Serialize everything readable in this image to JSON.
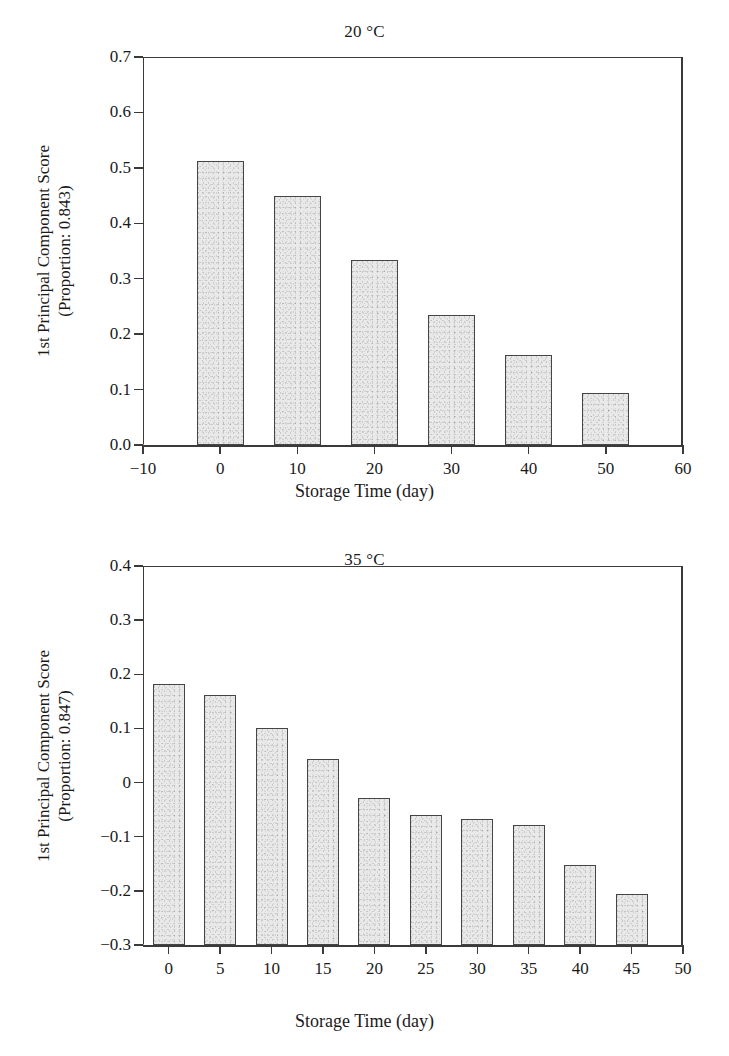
{
  "figure": {
    "background": "#ffffff",
    "bar_fill": "#e9e9e9",
    "bar_stroke": "#454545",
    "axis_color": "#3a3a3a"
  },
  "panels": [
    {
      "id": "panel-20C",
      "title": "20 °C",
      "xlabel": "Storage Time (day)",
      "ylabel_line1": "1st Principal Component Score",
      "ylabel_line2": "(Proportion: 0.843)",
      "xticks": [
        "−10",
        "0",
        "10",
        "20",
        "30",
        "40",
        "50",
        "60"
      ],
      "yticks": [
        "0.7",
        "0.6",
        "0.5",
        "0.4",
        "0.3",
        "0.2",
        "0.1",
        "0.0"
      ]
    },
    {
      "id": "panel-35C",
      "title": "35 °C",
      "xlabel": "Storage Time (day)",
      "ylabel_line1": "1st Principal Component Score",
      "ylabel_line2": "(Proportion: 0.847)",
      "xticks": [
        "0",
        "5",
        "10",
        "15",
        "20",
        "25",
        "30",
        "35",
        "40",
        "45",
        "50"
      ],
      "yticks": [
        "0.4",
        "0.3",
        "0.2",
        "0.1",
        "0",
        "−0.1",
        "−0.2",
        "−0.3"
      ]
    }
  ],
  "chart_data": [
    {
      "type": "bar",
      "title": "20 °C",
      "xlabel": "Storage Time (day)",
      "ylabel": "1st Principal Component Score (Proportion: 0.843)",
      "categories": [
        0,
        10,
        20,
        30,
        40,
        50
      ],
      "values": [
        0.512,
        0.449,
        0.334,
        0.234,
        0.163,
        0.094
      ],
      "xlim": [
        -10,
        60
      ],
      "ylim": [
        0.0,
        0.7
      ],
      "xtick_values": [
        -10,
        0,
        10,
        20,
        30,
        40,
        50,
        60
      ],
      "ytick_values": [
        0.0,
        0.1,
        0.2,
        0.3,
        0.4,
        0.5,
        0.6,
        0.7
      ],
      "grid": false,
      "legend": false,
      "bar_width_data_units": 6.1
    },
    {
      "type": "bar",
      "title": "35 °C",
      "xlabel": "Storage Time (day)",
      "ylabel": "1st Principal Component Score (Proportion: 0.847)",
      "categories": [
        0,
        5,
        10,
        15,
        20,
        25,
        30,
        35,
        40,
        45
      ],
      "values": [
        0.182,
        0.161,
        0.1,
        0.043,
        -0.028,
        -0.06,
        -0.068,
        -0.079,
        -0.152,
        -0.205
      ],
      "xlim": [
        -2.5,
        50
      ],
      "ylim": [
        -0.3,
        0.4
      ],
      "xtick_values": [
        0,
        5,
        10,
        15,
        20,
        25,
        30,
        35,
        40,
        45,
        50
      ],
      "ytick_values": [
        -0.3,
        -0.2,
        -0.1,
        0,
        0.1,
        0.2,
        0.3,
        0.4
      ],
      "grid": false,
      "legend": false,
      "baseline": -0.3,
      "bar_width_data_units": 3.1
    }
  ]
}
